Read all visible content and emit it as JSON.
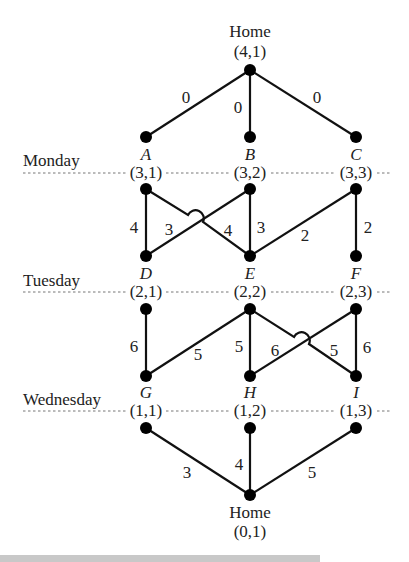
{
  "diagram": {
    "days": [
      {
        "label": "Monday",
        "y_line": 173
      },
      {
        "label": "Tuesday",
        "y_line": 292
      },
      {
        "label": "Wednesday",
        "y_line": 411
      }
    ],
    "homes": {
      "top": {
        "label": "Home",
        "coord": "(4,1)"
      },
      "bottom": {
        "label": "Home",
        "coord": "(0,1)"
      }
    },
    "nodes": [
      {
        "name": "A",
        "coord": "(3,1)"
      },
      {
        "name": "B",
        "coord": "(3,2)"
      },
      {
        "name": "C",
        "coord": "(3,3)"
      },
      {
        "name": "D",
        "coord": "(2,1)"
      },
      {
        "name": "E",
        "coord": "(2,2)"
      },
      {
        "name": "F",
        "coord": "(2,3)"
      },
      {
        "name": "G",
        "coord": "(1,1)"
      },
      {
        "name": "H",
        "coord": "(1,2)"
      },
      {
        "name": "I",
        "coord": "(1,3)"
      }
    ],
    "edges": {
      "home_to_A": "0",
      "home_to_B": "0",
      "home_to_C": "0",
      "A_to_D": "4",
      "A_to_E": "3",
      "B_to_D": "4",
      "B_to_E": "3",
      "C_to_E": "2",
      "C_to_F": "2",
      "D_to_G": "6",
      "E_to_G": "5",
      "E_to_H": "5",
      "E_to_I": "5",
      "F_to_H": "6",
      "F_to_I": "6",
      "G_to_home": "3",
      "H_to_home": "4",
      "I_to_home": "5"
    }
  }
}
